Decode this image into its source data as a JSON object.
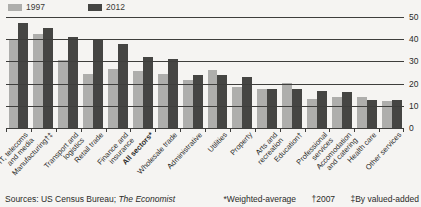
{
  "legend": {
    "label_1997": "1997",
    "label_2012": "2012"
  },
  "colors": {
    "background": "#f5f4f2",
    "series_1997": "#aeaeac",
    "series_2012": "#454543",
    "gridline": "#3e3e3c",
    "text": "#2b2b29"
  },
  "chart_data": {
    "type": "bar",
    "legend": [
      "1997",
      "2012"
    ],
    "legend_position": "top-left",
    "grid": true,
    "ylim": [
      0,
      50
    ],
    "yticks": [
      0,
      10,
      20,
      30,
      40,
      50
    ],
    "yaxis_side": "right",
    "bold_index": 5,
    "categories": [
      "IT, telecoms\nand media",
      "Manufacturing†‡",
      "Transport and\nlogistics",
      "Retail trade",
      "Finance and\ninsurance",
      "All sectors*",
      "Wholesale trade",
      "Administrative",
      "Utilities",
      "Property",
      "Arts and\nrecreation",
      "Education†",
      "Professional\nservices",
      "Accomodation\nand catering",
      "Health care",
      "Other services"
    ],
    "series": [
      {
        "name": "1997",
        "color": "#aeaeac",
        "values": [
          40,
          42.5,
          30.5,
          24.5,
          26.5,
          25.5,
          24.5,
          21.5,
          26,
          18.5,
          17.5,
          20.5,
          13,
          14,
          14,
          12
        ]
      },
      {
        "name": "2012",
        "color": "#454543",
        "values": [
          47.5,
          45,
          41,
          40,
          38,
          32,
          31,
          24,
          24,
          23,
          17.5,
          17.5,
          16.5,
          16,
          12.5,
          12.5
        ]
      }
    ]
  },
  "footer": {
    "sources_prefix": "Sources: US Census Bureau; ",
    "sources_italic": "The Economist",
    "footnotes": [
      "*Weighted-average",
      "†2007",
      "‡By valued-added"
    ]
  }
}
